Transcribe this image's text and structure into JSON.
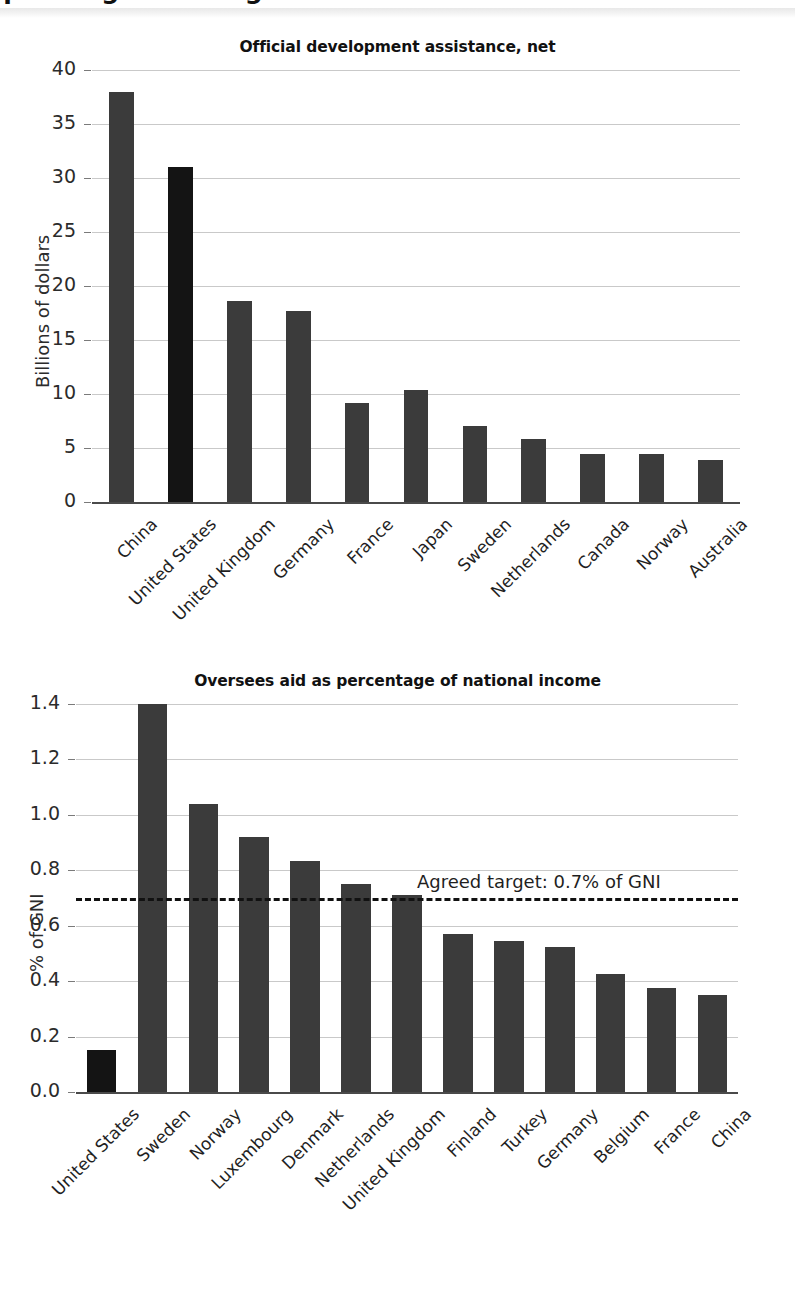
{
  "page": {
    "banner_title": "Spending on Foreign Aid"
  },
  "chart_data": [
    {
      "type": "bar",
      "title": "Official development assistance, net",
      "xlabel": "",
      "ylabel": "Billions of dollars",
      "ylim": [
        0,
        40
      ],
      "yticks": [
        "0",
        "5",
        "10",
        "15",
        "20",
        "25",
        "30",
        "35",
        "40"
      ],
      "grid": true,
      "legend": "none",
      "highlight_category": "United States",
      "categories": [
        "China",
        "United States",
        "United Kingdom",
        "Germany",
        "France",
        "Japan",
        "Sweden",
        "Netherlands",
        "Canada",
        "Norway",
        "Australia"
      ],
      "values": [
        38.0,
        31.0,
        18.6,
        17.7,
        9.2,
        10.4,
        7.0,
        5.8,
        4.4,
        4.4,
        3.9
      ]
    },
    {
      "type": "bar",
      "title": "Oversees aid as percentage of national income",
      "xlabel": "",
      "ylabel": "% of GNI",
      "ylim": [
        0.0,
        1.4
      ],
      "yticks": [
        "0.0",
        "0.2",
        "0.4",
        "0.6",
        "0.8",
        "1.0",
        "1.2",
        "1.4"
      ],
      "grid": true,
      "legend": "none",
      "highlight_category": "United States",
      "annotation": {
        "text": "Agreed target: 0.7% of GNI",
        "value": 0.7,
        "style": "dashed-horizontal-line"
      },
      "categories": [
        "United States",
        "Sweden",
        "Norway",
        "Luxembourg",
        "Denmark",
        "Netherlands",
        "United Kingdom",
        "Finland",
        "Turkey",
        "Germany",
        "Belgium",
        "France",
        "China"
      ],
      "values": [
        0.15,
        1.4,
        1.04,
        0.92,
        0.835,
        0.75,
        0.71,
        0.57,
        0.545,
        0.525,
        0.425,
        0.375,
        0.35
      ]
    }
  ],
  "colors": {
    "bar": "#3b3b3b",
    "bar_highlight": "#141414",
    "gridline": "#c9c9c9",
    "axis": "#4a4a4a",
    "text": "#1f1f1f"
  }
}
